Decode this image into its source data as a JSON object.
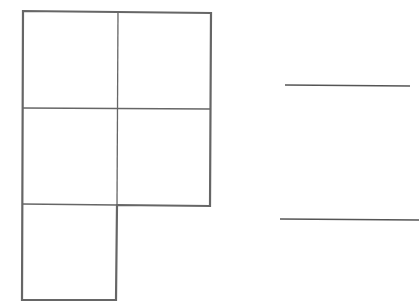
{
  "diagram": {
    "type": "composite-square-shape",
    "stroke_color": "#666666",
    "grid": {
      "rows": 3,
      "cols": 2,
      "filled_cells": [
        [
          0,
          0
        ],
        [
          0,
          1
        ],
        [
          1,
          0
        ],
        [
          1,
          1
        ],
        [
          2,
          0
        ]
      ],
      "square_count": 5
    },
    "outline_points": [
      [
        23,
        11
      ],
      [
        211,
        13
      ],
      [
        210,
        206
      ],
      [
        117,
        205
      ],
      [
        116,
        300
      ],
      [
        22,
        300
      ]
    ],
    "inner_lines": [
      {
        "x1": 118,
        "y1": 12,
        "x2": 117,
        "y2": 205
      },
      {
        "x1": 23,
        "y1": 108,
        "x2": 210,
        "y2": 109
      },
      {
        "x1": 22,
        "y1": 204,
        "x2": 117,
        "y2": 205
      }
    ],
    "answer_lines": [
      {
        "x1": 285,
        "y1": 85,
        "x2": 410,
        "y2": 86
      },
      {
        "x1": 280,
        "y1": 219,
        "x2": 419,
        "y2": 220
      }
    ]
  }
}
